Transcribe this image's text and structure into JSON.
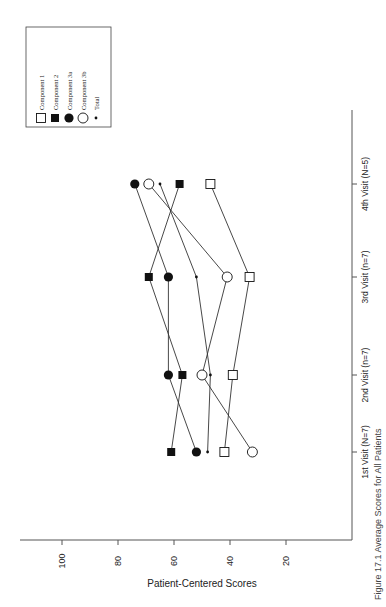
{
  "chart_data": {
    "type": "line",
    "orientation": "rotated-90 (categories on vertical right axis, values on horizontal bottom axis increasing to the left)",
    "title": "",
    "caption": "Figure 17.1 Average Scores for All Patients",
    "xlabel": "",
    "ylabel": "Patient-Centered Scores",
    "ylim": [
      10,
      105
    ],
    "yticks": [
      100,
      80,
      60,
      40,
      20
    ],
    "grid": false,
    "legend_position": "top-left box",
    "categories": [
      "1st Visit (N=7)",
      "2nd Visit (n=7)",
      "3rd Visit (n=7)",
      "4th Visit (N=5)"
    ],
    "series": [
      {
        "name": "Component 1",
        "marker": "open-square",
        "values": [
          42,
          39,
          33,
          47
        ]
      },
      {
        "name": "Component 2",
        "marker": "filled-square",
        "values": [
          61,
          57,
          69,
          58
        ]
      },
      {
        "name": "Component 3a",
        "marker": "filled-circle",
        "values": [
          52,
          62,
          62,
          74
        ]
      },
      {
        "name": "Component 3b",
        "marker": "open-circle",
        "values": [
          32,
          50,
          41,
          69
        ]
      },
      {
        "name": "Total",
        "marker": "small-dot",
        "values": [
          48,
          47,
          52,
          65
        ]
      }
    ]
  },
  "layout": {
    "axis_origin_x": 352,
    "axis_bottom_y": 540,
    "axis_left_x": 20,
    "axis_top_y": 110,
    "value_to_x": {
      "v100": 62,
      "v20": 286
    },
    "category_y": [
      452,
      375,
      277,
      184
    ]
  },
  "legend": {
    "items": [
      {
        "label": "Component 1",
        "marker": "open-square"
      },
      {
        "label": "Component 2",
        "marker": "filled-square"
      },
      {
        "label": "Component 3a",
        "marker": "filled-circle"
      },
      {
        "label": "Component 3b",
        "marker": "open-circle"
      },
      {
        "label": "Total",
        "marker": "small-dot"
      }
    ]
  },
  "colors": {
    "ink": "#111111",
    "axis": "#555555",
    "background": "#ffffff"
  }
}
